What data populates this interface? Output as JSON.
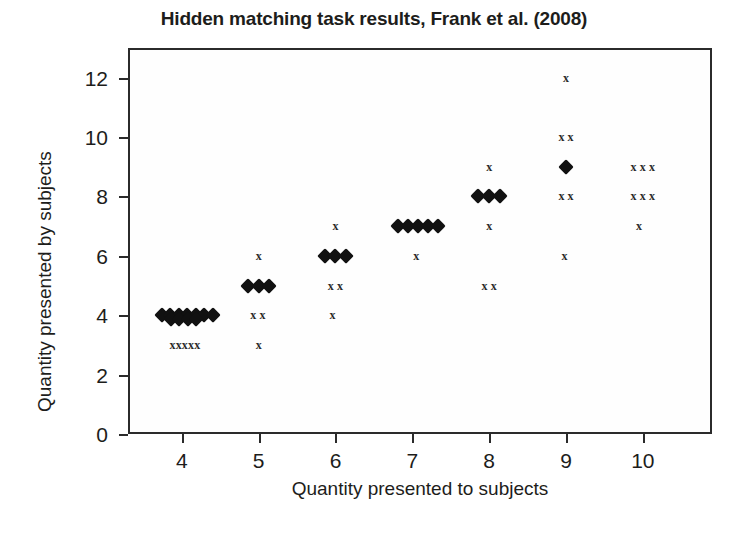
{
  "chart_data": {
    "type": "scatter",
    "title": "Hidden matching task results, Frank et al. (2008)",
    "xlabel": "Quantity presented to subjects",
    "ylabel": "Quantity presented by subjects",
    "xlim": [
      3.3,
      10.9
    ],
    "ylim": [
      0,
      13
    ],
    "xticks": [
      4,
      5,
      6,
      7,
      8,
      9,
      10
    ],
    "xtick_labels": [
      "4",
      "5",
      "6",
      "7",
      "8",
      "9",
      "10"
    ],
    "yticks": [
      0,
      2,
      4,
      6,
      8,
      10,
      12
    ],
    "ytick_labels": [
      "0",
      "2",
      "4",
      "6",
      "8",
      "10",
      "12"
    ],
    "grid": false,
    "legend": null,
    "marker_colors": {
      "diamond": "#111111",
      "cross": "#2a2a2a"
    },
    "series": [
      {
        "name": "matched responses",
        "marker": "diamond",
        "points": [
          {
            "x": 3.74,
            "y": 4.0
          },
          {
            "x": 3.85,
            "y": 4.0
          },
          {
            "x": 3.96,
            "y": 4.0
          },
          {
            "x": 4.07,
            "y": 4.0
          },
          {
            "x": 4.18,
            "y": 4.0
          },
          {
            "x": 4.29,
            "y": 4.0
          },
          {
            "x": 4.4,
            "y": 4.0
          },
          {
            "x": 3.86,
            "y": 3.86
          },
          {
            "x": 3.97,
            "y": 3.86
          },
          {
            "x": 4.08,
            "y": 3.86
          },
          {
            "x": 4.19,
            "y": 3.86
          },
          {
            "x": 4.86,
            "y": 5.0
          },
          {
            "x": 5.0,
            "y": 5.0
          },
          {
            "x": 5.14,
            "y": 5.0
          },
          {
            "x": 5.86,
            "y": 6.0
          },
          {
            "x": 6.0,
            "y": 6.0
          },
          {
            "x": 6.14,
            "y": 6.0
          },
          {
            "x": 6.82,
            "y": 7.0
          },
          {
            "x": 6.95,
            "y": 7.0
          },
          {
            "x": 7.08,
            "y": 7.0
          },
          {
            "x": 7.21,
            "y": 7.0
          },
          {
            "x": 7.34,
            "y": 7.0
          },
          {
            "x": 7.86,
            "y": 8.0
          },
          {
            "x": 8.0,
            "y": 8.0
          },
          {
            "x": 8.14,
            "y": 8.0
          },
          {
            "x": 9.0,
            "y": 9.0
          }
        ]
      },
      {
        "name": "unmatched responses",
        "marker": "cross",
        "points": [
          {
            "x": 3.88,
            "y": 3.0
          },
          {
            "x": 3.96,
            "y": 3.0
          },
          {
            "x": 4.04,
            "y": 3.0
          },
          {
            "x": 4.12,
            "y": 3.0
          },
          {
            "x": 4.2,
            "y": 3.0
          },
          {
            "x": 4.93,
            "y": 4.0
          },
          {
            "x": 5.05,
            "y": 4.0
          },
          {
            "x": 5.0,
            "y": 6.0
          },
          {
            "x": 5.0,
            "y": 3.0
          },
          {
            "x": 6.0,
            "y": 7.0
          },
          {
            "x": 5.94,
            "y": 5.0
          },
          {
            "x": 6.06,
            "y": 5.0
          },
          {
            "x": 5.96,
            "y": 4.0
          },
          {
            "x": 7.05,
            "y": 6.0
          },
          {
            "x": 8.0,
            "y": 9.0
          },
          {
            "x": 8.0,
            "y": 7.0
          },
          {
            "x": 7.94,
            "y": 5.0
          },
          {
            "x": 8.06,
            "y": 5.0
          },
          {
            "x": 9.0,
            "y": 12.0
          },
          {
            "x": 8.94,
            "y": 10.0
          },
          {
            "x": 9.06,
            "y": 10.0
          },
          {
            "x": 8.94,
            "y": 8.0
          },
          {
            "x": 9.06,
            "y": 8.0
          },
          {
            "x": 8.98,
            "y": 6.0
          },
          {
            "x": 9.88,
            "y": 9.0
          },
          {
            "x": 10.0,
            "y": 9.0
          },
          {
            "x": 10.12,
            "y": 9.0
          },
          {
            "x": 9.88,
            "y": 8.0
          },
          {
            "x": 10.0,
            "y": 8.0
          },
          {
            "x": 10.12,
            "y": 8.0
          },
          {
            "x": 9.95,
            "y": 7.0
          }
        ]
      }
    ],
    "marker_glyphs": {
      "cross": "x"
    }
  }
}
